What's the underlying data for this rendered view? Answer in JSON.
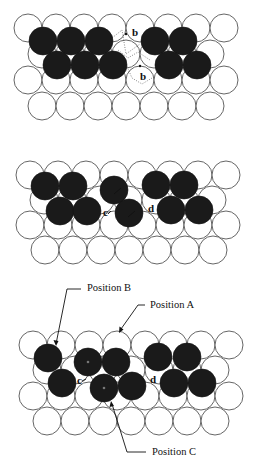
{
  "figure": {
    "colors": {
      "substrate_atom": "#ffffff",
      "substrate_outline": "#555555",
      "adatom": "#1a1a1a",
      "text": "#111111"
    },
    "atom_radius": 14,
    "panels": [
      {
        "id": "panel-1",
        "white_atoms": [
          [
            28,
            28
          ],
          [
            56,
            28
          ],
          [
            84,
            28
          ],
          [
            112,
            28
          ],
          [
            140,
            28
          ],
          [
            168,
            28
          ],
          [
            196,
            28
          ],
          [
            224,
            28
          ],
          [
            42,
            54
          ],
          [
            70,
            54
          ],
          [
            98,
            54
          ],
          [
            126,
            54
          ],
          [
            154,
            54
          ],
          [
            182,
            54
          ],
          [
            210,
            54
          ],
          [
            28,
            80
          ],
          [
            56,
            80
          ],
          [
            84,
            80
          ],
          [
            112,
            80
          ],
          [
            140,
            80
          ],
          [
            168,
            80
          ],
          [
            196,
            80
          ],
          [
            224,
            80
          ],
          [
            42,
            106
          ],
          [
            70,
            106
          ],
          [
            98,
            106
          ],
          [
            126,
            106
          ],
          [
            154,
            106
          ],
          [
            182,
            106
          ],
          [
            210,
            106
          ]
        ],
        "dark_atoms": [
          [
            43,
            41
          ],
          [
            71,
            41
          ],
          [
            99,
            41
          ],
          [
            155,
            41
          ],
          [
            183,
            41
          ],
          [
            57,
            65
          ],
          [
            85,
            65
          ],
          [
            113,
            65
          ],
          [
            169,
            65
          ],
          [
            197,
            65
          ]
        ],
        "labels": [
          {
            "text": "b",
            "x": 132,
            "y": 36
          },
          {
            "text": "b",
            "x": 140,
            "y": 80
          }
        ]
      },
      {
        "id": "panel-2",
        "white_atoms": [
          [
            30,
            175
          ],
          [
            58,
            175
          ],
          [
            86,
            175
          ],
          [
            114,
            175
          ],
          [
            142,
            175
          ],
          [
            170,
            175
          ],
          [
            198,
            175
          ],
          [
            226,
            175
          ],
          [
            44,
            200
          ],
          [
            72,
            200
          ],
          [
            100,
            200
          ],
          [
            128,
            200
          ],
          [
            156,
            200
          ],
          [
            184,
            200
          ],
          [
            212,
            200
          ],
          [
            30,
            225
          ],
          [
            58,
            225
          ],
          [
            86,
            225
          ],
          [
            114,
            225
          ],
          [
            142,
            225
          ],
          [
            170,
            225
          ],
          [
            198,
            225
          ],
          [
            226,
            225
          ],
          [
            45,
            250
          ],
          [
            73,
            250
          ],
          [
            101,
            250
          ],
          [
            129,
            250
          ],
          [
            157,
            250
          ],
          [
            185,
            250
          ],
          [
            213,
            250
          ]
        ],
        "dark_atoms": [
          [
            45,
            186
          ],
          [
            73,
            186
          ],
          [
            114,
            190
          ],
          [
            156,
            185
          ],
          [
            184,
            185
          ],
          [
            60,
            211
          ],
          [
            87,
            211
          ],
          [
            129,
            213
          ],
          [
            171,
            210
          ],
          [
            199,
            210
          ]
        ],
        "labels": [
          {
            "text": "c",
            "x": 103,
            "y": 216
          },
          {
            "text": "d",
            "x": 148,
            "y": 212
          }
        ]
      },
      {
        "id": "panel-3",
        "white_atoms": [
          [
            33,
            345
          ],
          [
            61,
            345
          ],
          [
            89,
            345
          ],
          [
            117,
            345
          ],
          [
            145,
            345
          ],
          [
            173,
            345
          ],
          [
            201,
            345
          ],
          [
            229,
            345
          ],
          [
            47,
            370
          ],
          [
            75,
            370
          ],
          [
            103,
            370
          ],
          [
            131,
            370
          ],
          [
            159,
            370
          ],
          [
            187,
            370
          ],
          [
            215,
            370
          ],
          [
            33,
            396
          ],
          [
            61,
            396
          ],
          [
            89,
            396
          ],
          [
            117,
            396
          ],
          [
            145,
            396
          ],
          [
            173,
            396
          ],
          [
            201,
            396
          ],
          [
            229,
            396
          ],
          [
            47,
            421
          ],
          [
            75,
            421
          ],
          [
            103,
            421
          ],
          [
            131,
            421
          ],
          [
            159,
            421
          ],
          [
            187,
            421
          ],
          [
            215,
            421
          ]
        ],
        "dark_atoms": [
          [
            48,
            358
          ],
          [
            88,
            362
          ],
          [
            116,
            362
          ],
          [
            158,
            357
          ],
          [
            187,
            357
          ],
          [
            62,
            383
          ],
          [
            104,
            388
          ],
          [
            132,
            386
          ],
          [
            174,
            383
          ],
          [
            202,
            383
          ]
        ],
        "labels": [
          {
            "text": "c",
            "x": 77,
            "y": 384
          },
          {
            "text": "d",
            "x": 150,
            "y": 383
          }
        ],
        "annotations": [
          {
            "text": "Position B",
            "x": 87,
            "y": 291
          },
          {
            "text": "Position A",
            "x": 150,
            "y": 308
          },
          {
            "text": "Position C",
            "x": 152,
            "y": 455
          }
        ]
      }
    ]
  }
}
